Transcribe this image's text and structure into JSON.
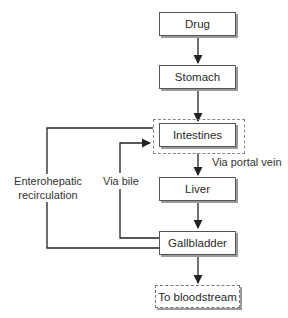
{
  "diagram": {
    "nodes": [
      {
        "id": "drug",
        "label": "Drug"
      },
      {
        "id": "stomach",
        "label": "Stomach"
      },
      {
        "id": "intestines",
        "label": "Intestines"
      },
      {
        "id": "liver",
        "label": "Liver"
      },
      {
        "id": "gallbladder",
        "label": "Gallbladder"
      },
      {
        "id": "bloodstream",
        "label": "To bloodstream"
      }
    ],
    "edge_labels": {
      "portal_vein": "Via portal vein",
      "bile": "Via bile",
      "enterohepatic_line1": "Enterohepatic",
      "enterohepatic_line2": "recirculation"
    },
    "colors": {
      "line": "#222222",
      "box_border": "#555555",
      "shadow": "#9a9a9a",
      "dashed": "#888888"
    }
  }
}
